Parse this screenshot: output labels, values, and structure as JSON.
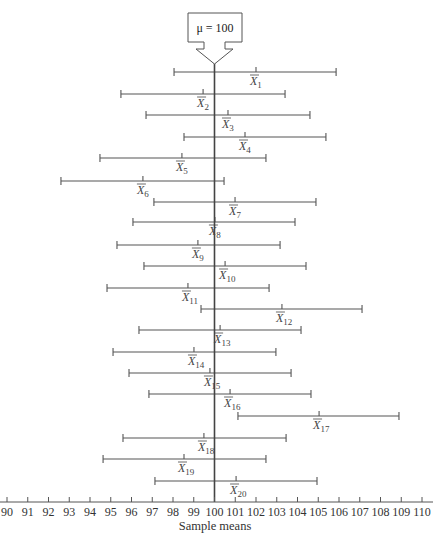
{
  "chart_data": {
    "type": "errorbar",
    "title": "",
    "annotation": "μ = 100",
    "mu": 100,
    "xlabel": "Sample means",
    "ylabel": "",
    "xlim": [
      90,
      110
    ],
    "x_ticks": [
      90,
      91,
      92,
      93,
      94,
      95,
      96,
      97,
      98,
      99,
      100,
      101,
      102,
      103,
      104,
      105,
      106,
      107,
      108,
      109,
      110
    ],
    "grid": false,
    "legend": null,
    "series": [
      {
        "name": "X̄1",
        "label_sub": "1",
        "lower": 98.05,
        "mean": 102.0,
        "upper": 105.86
      },
      {
        "name": "X̄2",
        "label_sub": "2",
        "lower": 95.49,
        "mean": 99.45,
        "upper": 103.4
      },
      {
        "name": "X̄3",
        "label_sub": "3",
        "lower": 96.7,
        "mean": 100.65,
        "upper": 104.6
      },
      {
        "name": "X̄4",
        "label_sub": "4",
        "lower": 98.53,
        "mean": 101.47,
        "upper": 105.37
      },
      {
        "name": "X̄5",
        "label_sub": "5",
        "lower": 94.48,
        "mean": 98.43,
        "upper": 102.48
      },
      {
        "name": "X̄6",
        "label_sub": "6",
        "lower": 92.6,
        "mean": 96.55,
        "upper": 100.46
      },
      {
        "name": "X̄7",
        "label_sub": "7",
        "lower": 97.08,
        "mean": 100.99,
        "upper": 104.89
      },
      {
        "name": "X̄8",
        "label_sub": "8",
        "lower": 96.07,
        "mean": 100.02,
        "upper": 103.88
      },
      {
        "name": "X̄9",
        "label_sub": "9",
        "lower": 95.3,
        "mean": 99.2,
        "upper": 103.16
      },
      {
        "name": "X̄10",
        "label_sub": "10",
        "lower": 96.6,
        "mean": 100.51,
        "upper": 104.41
      },
      {
        "name": "X̄11",
        "label_sub": "11",
        "lower": 94.82,
        "mean": 98.72,
        "upper": 102.63
      },
      {
        "name": "X̄12",
        "label_sub": "12",
        "lower": 99.35,
        "mean": 103.25,
        "upper": 107.11
      },
      {
        "name": "X̄13",
        "label_sub": "13",
        "lower": 96.36,
        "mean": 100.27,
        "upper": 104.17
      },
      {
        "name": "X̄14",
        "label_sub": "14",
        "lower": 95.11,
        "mean": 99.01,
        "upper": 102.96
      },
      {
        "name": "X̄15",
        "label_sub": "15",
        "lower": 95.88,
        "mean": 99.78,
        "upper": 103.69
      },
      {
        "name": "X̄16",
        "label_sub": "16",
        "lower": 96.84,
        "mean": 100.75,
        "upper": 104.65
      },
      {
        "name": "X̄17",
        "label_sub": "17",
        "lower": 101.13,
        "mean": 105.04,
        "upper": 108.89
      },
      {
        "name": "X̄18",
        "label_sub": "18",
        "lower": 95.59,
        "mean": 99.49,
        "upper": 103.45
      },
      {
        "name": "X̄19",
        "label_sub": "19",
        "lower": 94.63,
        "mean": 98.53,
        "upper": 102.48
      },
      {
        "name": "X̄20",
        "label_sub": "20",
        "lower": 97.13,
        "mean": 101.04,
        "upper": 104.94
      }
    ]
  },
  "colors": {
    "line": "#555555",
    "mu_line": "#444444",
    "text": "#333333"
  }
}
